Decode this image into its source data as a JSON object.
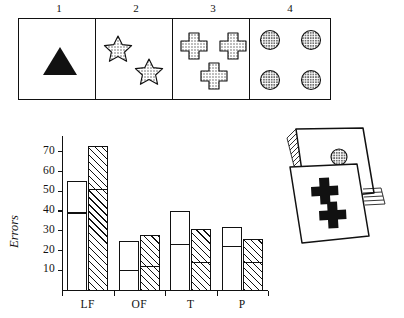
{
  "figure": {
    "caption_present": false
  },
  "stimulus_cards": {
    "items": [
      {
        "number": "1",
        "shape": "triangle",
        "count": 1,
        "fill": "solid-black"
      },
      {
        "number": "2",
        "shape": "star",
        "count": 2,
        "fill": "stippled"
      },
      {
        "number": "3",
        "shape": "cross",
        "count": 3,
        "fill": "stippled"
      },
      {
        "number": "4",
        "shape": "circle",
        "count": 4,
        "fill": "stippled"
      }
    ]
  },
  "card_stack": {
    "top_card_symbol": "circle",
    "top_card_symbol_count": 1,
    "front_card_symbol": "cross",
    "front_card_symbol_count": 2
  },
  "chart_data": {
    "type": "bar",
    "title": "",
    "xlabel": "",
    "ylabel": "Errors",
    "categories": [
      "LF",
      "OF",
      "T",
      "P"
    ],
    "ylim": [
      0,
      78
    ],
    "yticks": [
      10,
      20,
      30,
      40,
      50,
      60,
      70
    ],
    "ytick_labels": [
      "10",
      "20",
      "30",
      "40",
      "50",
      "60",
      "70"
    ],
    "grid": false,
    "legend": [],
    "series": [
      {
        "name": "open",
        "fill": "white",
        "values": [
          55,
          25,
          40,
          32
        ]
      },
      {
        "name": "hatched",
        "fill": "diagonal-hatch",
        "values": [
          73,
          28,
          31,
          26
        ]
      }
    ],
    "segment_dividers": [
      {
        "name": "open",
        "values": [
          39,
          10,
          23,
          22
        ]
      },
      {
        "name": "hatched",
        "values": [
          51,
          12,
          14,
          14
        ]
      }
    ]
  },
  "colors": {
    "ink": "#111111",
    "paper": "#ffffff",
    "stipple_gray": "#6f6f6f"
  }
}
